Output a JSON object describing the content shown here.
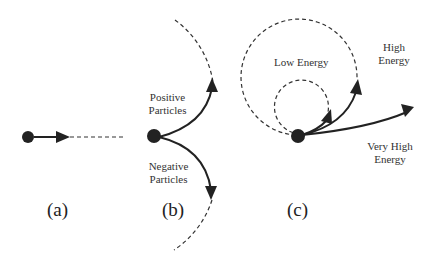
{
  "panels": {
    "a": {
      "caption": "(a)"
    },
    "b": {
      "caption": "(b)",
      "positive_label_1": "Positive",
      "positive_label_2": "Particles",
      "negative_label_1": "Negative",
      "negative_label_2": "Particles"
    },
    "c": {
      "caption": "(c)",
      "low_label": "Low Energy",
      "high_label_1": "High",
      "high_label_2": "Energy",
      "very_high_label_1": "Very High",
      "very_high_label_2": "Energy"
    }
  },
  "colors": {
    "stroke": "#222222",
    "text": "#333333",
    "background": "#ffffff"
  }
}
